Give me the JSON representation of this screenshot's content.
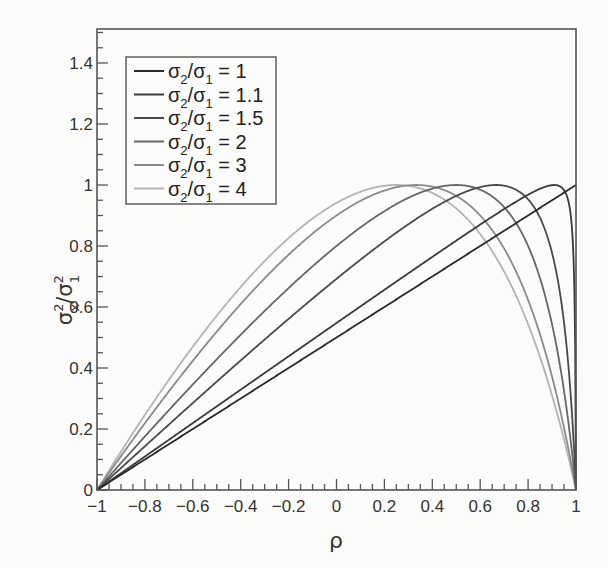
{
  "chart_data": {
    "type": "line",
    "title": "",
    "xlabel": "ρ",
    "ylabel": "σx²/σ1²",
    "xlim": [
      -1,
      1
    ],
    "ylim": [
      0,
      1.5
    ],
    "grid": false,
    "legend_position": "upper-left",
    "x_ticks": [
      "−1",
      "−0.8",
      "−0.6",
      "−0.4",
      "−0.2",
      "0",
      "0.2",
      "0.4",
      "0.6",
      "0.8",
      "1"
    ],
    "x_tick_values": [
      -1,
      -0.8,
      -0.6,
      -0.4,
      -0.2,
      0,
      0.2,
      0.4,
      0.6,
      0.8,
      1
    ],
    "y_ticks": [
      "0",
      "0.2",
      "0.4",
      "0.6",
      "0.8",
      "1",
      "1.2",
      "1.4"
    ],
    "y_tick_values": [
      0,
      0.2,
      0.4,
      0.6,
      0.8,
      1,
      1.2,
      1.4
    ],
    "formula": "k^2(1-ρ^2)/(1+k^2-2kρ), k = σ2/σ1",
    "series": [
      {
        "name": "σ2/σ1 = 1",
        "k": 1,
        "color": "#2a2a2a",
        "peak_rho": 1.0,
        "peak_value": 1
      },
      {
        "name": "σ2/σ1 = 1.1",
        "k": 1.1,
        "color": "#3a3a3a",
        "peak_rho": 0.909,
        "peak_value": 1
      },
      {
        "name": "σ2/σ1 = 1.5",
        "k": 1.5,
        "color": "#4a4a4a",
        "peak_rho": 0.667,
        "peak_value": 1
      },
      {
        "name": "σ2/σ1 = 2",
        "k": 2,
        "color": "#666666",
        "peak_rho": 0.5,
        "peak_value": 1
      },
      {
        "name": "σ2/σ1 = 3",
        "k": 3,
        "color": "#8a8a8a",
        "peak_rho": 0.333,
        "peak_value": 1
      },
      {
        "name": "σ2/σ1 = 4",
        "k": 4,
        "color": "#b3b3b3",
        "peak_rho": 0.25,
        "peak_value": 1
      }
    ]
  },
  "legend": {
    "entries": [
      {
        "prefix": "σ",
        "sub1": "2",
        "mid": "/σ",
        "sub2": "1",
        "suffix": " = 1"
      },
      {
        "prefix": "σ",
        "sub1": "2",
        "mid": "/σ",
        "sub2": "1",
        "suffix": " = 1.1"
      },
      {
        "prefix": "σ",
        "sub1": "2",
        "mid": "/σ",
        "sub2": "1",
        "suffix": " = 1.5"
      },
      {
        "prefix": "σ",
        "sub1": "2",
        "mid": "/σ",
        "sub2": "1",
        "suffix": " = 2"
      },
      {
        "prefix": "σ",
        "sub1": "2",
        "mid": "/σ",
        "sub2": "1",
        "suffix": " = 3"
      },
      {
        "prefix": "σ",
        "sub1": "2",
        "mid": "/σ",
        "sub2": "1",
        "suffix": " = 4"
      }
    ]
  },
  "axes": {
    "x_label": "ρ",
    "y_label_main1": "σ",
    "y_label_sup1": "2",
    "y_label_sub1": "x",
    "y_label_mid": "/σ",
    "y_label_sup2": "2",
    "y_label_sub2": "1"
  }
}
